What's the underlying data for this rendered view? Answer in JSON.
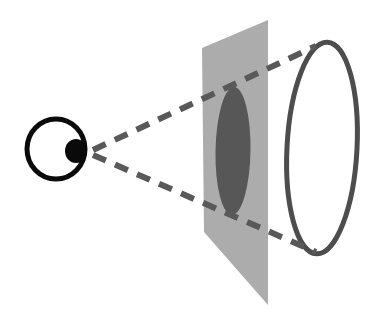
{
  "figure": {
    "background_color": "#ffffff"
  },
  "colors": {
    "eye_outline": "#0a0a0a",
    "pupil_fill": "#0a0a0a",
    "image_plane_fill": "#acacac",
    "projected_shape_fill": "#575757",
    "sight_line": "#595959",
    "object_outline": "#4d4d4d"
  },
  "elements": {
    "eye": {
      "name": "eye",
      "label": "eye",
      "center_x": 56,
      "center_y": 149,
      "radius_x": 29,
      "radius_y": 30,
      "stroke_width": 5,
      "pupil": {
        "label": "pupil",
        "center_x": 76,
        "center_y": 151,
        "radius_x": 11,
        "radius_y": 12
      }
    },
    "image_plane": {
      "name": "image-plane",
      "label": "image plane",
      "corners": [
        {
          "x": 268,
          "y": 20
        },
        {
          "x": 202,
          "y": 48
        },
        {
          "x": 204,
          "y": 232
        },
        {
          "x": 268,
          "y": 305
        }
      ],
      "fill": "#acacac"
    },
    "projected_shape": {
      "name": "projected-image",
      "label": "projected image",
      "center_x": 233,
      "center_y": 151,
      "radius_x": 17.5,
      "radius_y": 64,
      "rotation_deg": 1,
      "fill": "#575757"
    },
    "object_ellipse": {
      "name": "object",
      "label": "object",
      "center_x": 322,
      "center_y": 148,
      "radius_x": 35,
      "radius_y": 106,
      "rotation_deg": 3,
      "stroke_width": 5,
      "stroke": "#4d4d4d"
    },
    "sight_line_upper": {
      "name": "sight-line-upper",
      "label": "line of sight (upper)",
      "x1": 93,
      "y1": 150,
      "x2": 316,
      "y2": 46,
      "dash": "14 10",
      "stroke_width": 6
    },
    "sight_line_lower": {
      "name": "sight-line-lower",
      "label": "line of sight (lower)",
      "x1": 93,
      "y1": 155,
      "x2": 316,
      "y2": 252,
      "dash": "14 10",
      "stroke_width": 6
    }
  }
}
